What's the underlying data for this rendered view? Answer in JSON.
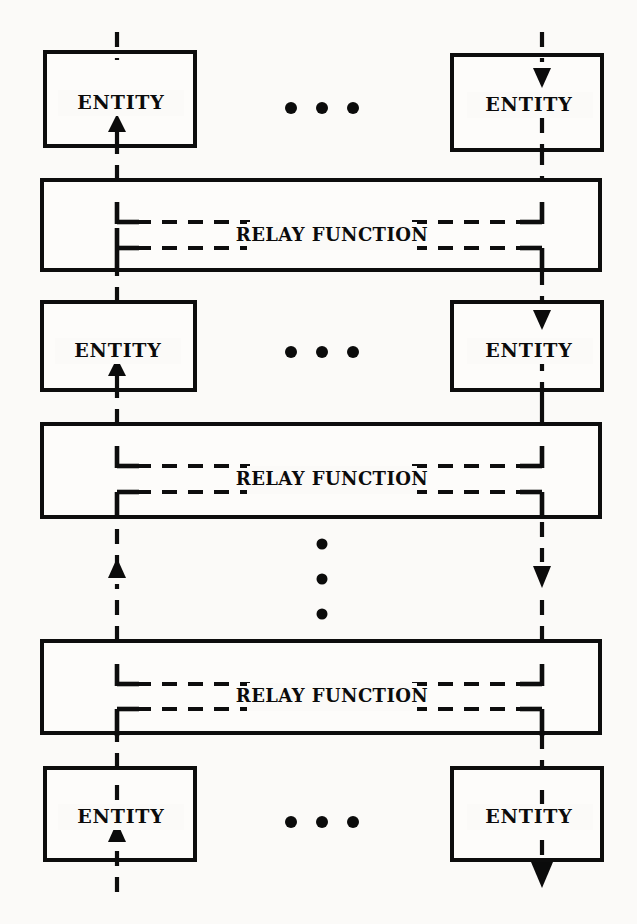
{
  "diagram": {
    "background_color": "#fbfaf8",
    "ink_color": "#0d0d0d",
    "entity_label": "ENTITY",
    "relay_label": "RELAY FUNCTION",
    "horizontal_ellipsis": "• • •",
    "vertical_ellipsis_dots": 3,
    "entity_rows": [
      {
        "row_id": "entity-row-top",
        "left": {
          "label": "ENTITY",
          "flow": "upward",
          "arrow": "up"
        },
        "right": {
          "label": "ENTITY",
          "flow": "downward",
          "arrow": "down"
        },
        "separator": "• • •"
      },
      {
        "row_id": "entity-row-second",
        "left": {
          "label": "ENTITY",
          "flow": "upward",
          "arrow": "up"
        },
        "right": {
          "label": "ENTITY",
          "flow": "downward",
          "arrow": "down"
        },
        "separator": "• • •"
      },
      {
        "row_id": "entity-row-bottom",
        "left": {
          "label": "ENTITY",
          "flow": "upward",
          "arrow": "up"
        },
        "right": {
          "label": "ENTITY",
          "flow": "downward",
          "arrow": "down"
        },
        "separator": "• • •"
      }
    ],
    "relay_bands": [
      {
        "band_id": "relay-band-1",
        "label": "RELAY FUNCTION"
      },
      {
        "band_id": "relay-band-2",
        "label": "RELAY FUNCTION"
      },
      {
        "band_id": "relay-band-3",
        "label": "RELAY FUNCTION"
      }
    ],
    "flows": {
      "left_column_direction": "up",
      "right_column_direction": "down",
      "left_column_name": "upward relay path",
      "right_column_name": "downward relay path"
    }
  }
}
